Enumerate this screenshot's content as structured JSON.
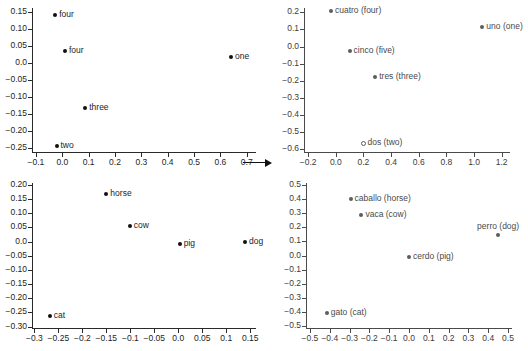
{
  "figure": {
    "arrow": {
      "name": "transformation-arrow",
      "direction": "right"
    }
  },
  "chart_data": [
    {
      "id": "english-numbers",
      "type": "scatter",
      "title": "",
      "xlabel": "",
      "ylabel": "",
      "xlim": [
        -0.115,
        0.735
      ],
      "ylim": [
        -0.262,
        0.162
      ],
      "xticks": [
        -0.1,
        0.0,
        0.1,
        0.2,
        0.3,
        0.4,
        0.5,
        0.6,
        0.7
      ],
      "xticklabels": [
        "−0.1",
        "0.0",
        "0.1",
        "0.2",
        "0.3",
        "0.4",
        "0.5",
        "0.6",
        "0.7"
      ],
      "yticks": [
        -0.25,
        -0.2,
        -0.15,
        -0.1,
        -0.05,
        0.0,
        0.05,
        0.1,
        0.15
      ],
      "yticklabels": [
        "−0.25",
        "−0.20",
        "−0.15",
        "−0.10",
        "−0.05",
        "0.0",
        "0.05",
        "0.10",
        "0.15"
      ],
      "grid": false,
      "legend": null,
      "points": [
        {
          "label": "four",
          "x": -0.027,
          "y": 0.14,
          "marker": "filled",
          "label_pos": "right"
        },
        {
          "label": "four",
          "x": 0.01,
          "y": 0.035,
          "marker": "filled",
          "label_pos": "right"
        },
        {
          "label": "one",
          "x": 0.64,
          "y": 0.017,
          "marker": "filled",
          "label_pos": "right"
        },
        {
          "label": "three",
          "x": 0.087,
          "y": -0.131,
          "marker": "filled",
          "label_pos": "right"
        },
        {
          "label": "two",
          "x": -0.022,
          "y": -0.245,
          "marker": "filled",
          "label_pos": "right"
        }
      ]
    },
    {
      "id": "spanish-numbers",
      "type": "scatter",
      "title": "",
      "xlabel": "",
      "ylabel": "",
      "xlim": [
        -0.23,
        1.26
      ],
      "ylim": [
        -0.615,
        0.225
      ],
      "xticks": [
        -0.2,
        0.0,
        0.2,
        0.4,
        0.6,
        0.8,
        1.0,
        1.2
      ],
      "xticklabels": [
        "−0.2",
        "0.0",
        "0.2",
        "0.4",
        "0.6",
        "0.8",
        "1.0",
        "1.2"
      ],
      "yticks": [
        -0.6,
        -0.5,
        -0.4,
        -0.3,
        -0.2,
        -0.1,
        0.0,
        0.1,
        0.2
      ],
      "yticklabels": [
        "−0.6",
        "−0.5",
        "−0.4",
        "−0.3",
        "−0.2",
        "−0.1",
        "0.0",
        "0.1",
        "0.2"
      ],
      "grid": false,
      "legend": null,
      "points": [
        {
          "label": "cuatro (four)",
          "x": -0.035,
          "y": 0.205,
          "marker": "filled",
          "label_pos": "right"
        },
        {
          "label": "uno (one)",
          "x": 1.06,
          "y": 0.112,
          "marker": "filled",
          "label_pos": "right"
        },
        {
          "label": "cinco (five)",
          "x": 0.1,
          "y": -0.025,
          "marker": "filled",
          "label_pos": "right"
        },
        {
          "label": "tres (three)",
          "x": 0.285,
          "y": -0.18,
          "marker": "filled",
          "label_pos": "right"
        },
        {
          "label": "dos (two)",
          "x": 0.2,
          "y": -0.562,
          "marker": "hollow",
          "label_pos": "right"
        }
      ]
    },
    {
      "id": "english-animals",
      "type": "scatter",
      "title": "",
      "xlabel": "",
      "ylabel": "",
      "xlim": [
        -0.305,
        0.162
      ],
      "ylim": [
        -0.305,
        0.207
      ],
      "xticks": [
        -0.3,
        -0.25,
        -0.2,
        -0.15,
        -0.1,
        -0.05,
        0.0,
        0.05,
        0.1,
        0.15
      ],
      "xticklabels": [
        "−0.3",
        "−0.25",
        "−0.2",
        "−0.15",
        "−0.1",
        "−0.05",
        "0.0",
        "0.05",
        "0.1",
        "0.15"
      ],
      "yticks": [
        -0.3,
        -0.25,
        -0.2,
        -0.15,
        -0.1,
        -0.05,
        0.0,
        0.05,
        0.1,
        0.15,
        0.2
      ],
      "yticklabels": [
        "−0.30",
        "−0.25",
        "−0.20",
        "−0.15",
        "−0.10",
        "−0.05",
        "0.0",
        "0.05",
        "0.10",
        "0.15",
        "0.20"
      ],
      "grid": false,
      "legend": null,
      "points": [
        {
          "label": "horse",
          "x": -0.15,
          "y": 0.167,
          "marker": "filled",
          "label_pos": "right"
        },
        {
          "label": "cow",
          "x": -0.101,
          "y": 0.056,
          "marker": "filled",
          "label_pos": "right"
        },
        {
          "label": "pig",
          "x": 0.003,
          "y": -0.008,
          "marker": "filled",
          "label_pos": "right"
        },
        {
          "label": "dog",
          "x": 0.139,
          "y": -0.001,
          "marker": "filled",
          "label_pos": "right"
        },
        {
          "label": "cat",
          "x": -0.268,
          "y": -0.261,
          "marker": "filled",
          "label_pos": "right"
        }
      ]
    },
    {
      "id": "spanish-animals",
      "type": "scatter",
      "title": "",
      "xlabel": "",
      "ylabel": "",
      "xlim": [
        -0.52,
        0.52
      ],
      "ylim": [
        -0.515,
        0.515
      ],
      "xticks": [
        -0.5,
        -0.4,
        -0.3,
        -0.2,
        -0.1,
        0.0,
        0.1,
        0.2,
        0.3,
        0.4,
        0.5
      ],
      "xticklabels": [
        "−0.5",
        "−0.4",
        "−0.3",
        "−0.2",
        "−0.1",
        "0.0",
        "0.1",
        "0.2",
        "0.3",
        "0.4",
        "0.5"
      ],
      "yticks": [
        -0.5,
        -0.4,
        -0.3,
        -0.2,
        -0.1,
        0.0,
        0.1,
        0.2,
        0.3,
        0.4,
        0.5
      ],
      "yticklabels": [
        "−0.5",
        "−0.4",
        "−0.3",
        "−0.2",
        "−0.1",
        "0.0",
        "0.1",
        "0.2",
        "0.3",
        "0.4",
        "0.5"
      ],
      "grid": false,
      "legend": null,
      "points": [
        {
          "label": "caballo (horse)",
          "x": -0.295,
          "y": 0.4,
          "marker": "filled",
          "label_pos": "right"
        },
        {
          "label": "vaca (cow)",
          "x": -0.24,
          "y": 0.29,
          "marker": "filled",
          "label_pos": "right"
        },
        {
          "label": "perro (dog)",
          "x": 0.45,
          "y": 0.148,
          "marker": "filled",
          "label_pos": "above"
        },
        {
          "label": "cerdo (pig)",
          "x": 0.0,
          "y": -0.012,
          "marker": "filled",
          "label_pos": "right"
        },
        {
          "label": "gato (cat)",
          "x": -0.415,
          "y": -0.405,
          "marker": "filled",
          "label_pos": "right"
        }
      ]
    }
  ]
}
